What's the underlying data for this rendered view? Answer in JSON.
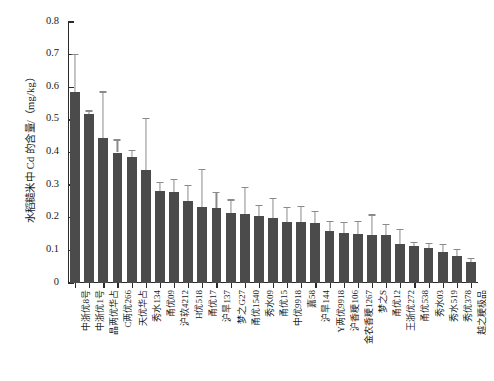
{
  "chart_data": {
    "type": "bar",
    "title": "",
    "xlabel": "",
    "ylabel": "水稻糙米中 Cd 的含量/（mg/kg）",
    "ylim": [
      0,
      0.8
    ],
    "ytick_labels": [
      "0",
      "0.1",
      "0.2",
      "0.3",
      "0.4",
      "0.5",
      "0.6",
      "0.7",
      "0.8"
    ],
    "ytick_values": [
      0,
      0.1,
      0.2,
      0.3,
      0.4,
      0.5,
      0.6,
      0.7,
      0.8
    ],
    "grid": false,
    "legend": false,
    "bar_color": "#4b4b4b",
    "error_color": "#8a8a8a",
    "categories": [
      "中浙优8号",
      "中浙优1号",
      "晶两优华占",
      "C两优266",
      "天优华占",
      "秀水134",
      "甬优09",
      "沪软4212",
      "H优518",
      "甬优17",
      "沪旱137",
      "梦之G27",
      "甬优1540",
      "秀水09",
      "甬优15",
      "中优9918",
      "嘉58",
      "沪旱144",
      "Y两优9918",
      "沪香粳106",
      "金农香粳1267",
      "梦之S",
      "甬优12",
      "王浙优272",
      "甬优538",
      "秀水03",
      "秀水519",
      "秀优378",
      "越之粳极品"
    ],
    "values": [
      0.585,
      0.517,
      0.445,
      0.4,
      0.387,
      0.346,
      0.283,
      0.278,
      0.252,
      0.232,
      0.229,
      0.216,
      0.213,
      0.205,
      0.2,
      0.188,
      0.186,
      0.183,
      0.16,
      0.152,
      0.15,
      0.148,
      0.146,
      0.12,
      0.112,
      0.108,
      0.095,
      0.082,
      0.065
    ],
    "errors": [
      0.118,
      0.012,
      0.142,
      0.04,
      0.022,
      0.16,
      0.028,
      0.042,
      0.048,
      0.118,
      0.05,
      0.04,
      0.082,
      0.035,
      0.06,
      0.046,
      0.05,
      0.038,
      0.03,
      0.036,
      0.04,
      0.062,
      0.034,
      0.045,
      0.015,
      0.014,
      0.026,
      0.022,
      0.012
    ]
  }
}
